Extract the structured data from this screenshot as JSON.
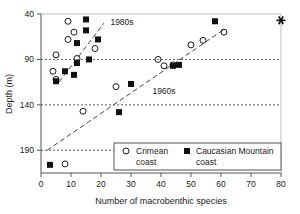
{
  "chart_data": {
    "type": "scatter",
    "title": "",
    "xlabel": "Number of macrobenthic species",
    "ylabel": "Depth (m)",
    "xlim": [
      0,
      80
    ],
    "ylim": [
      40,
      215
    ],
    "y_inverted": true,
    "xticks": [
      0,
      10,
      20,
      30,
      40,
      50,
      60,
      70,
      80
    ],
    "xtick_labels": [
      "0",
      "10",
      "20",
      "30",
      "40",
      "50",
      "60",
      "70",
      "80"
    ],
    "yticks": [
      40,
      90,
      140,
      190
    ],
    "ytick_labels": [
      "40",
      "90",
      "140",
      "190"
    ],
    "grid": "horizontal-dashed",
    "gridlines_y": [
      90,
      140,
      190
    ],
    "legend_position": "lower-right",
    "series": [
      {
        "name": "Crimean coast",
        "marker": "open-circle",
        "color": "#1a1a1a",
        "points": [
          [
            9,
            48
          ],
          [
            11,
            60
          ],
          [
            9,
            68
          ],
          [
            5,
            85
          ],
          [
            4,
            103
          ],
          [
            12,
            89
          ],
          [
            18,
            78
          ],
          [
            5,
            112
          ],
          [
            14,
            147
          ],
          [
            25,
            120
          ],
          [
            39,
            90
          ],
          [
            41,
            97
          ],
          [
            44,
            96
          ],
          [
            50,
            74
          ],
          [
            54,
            69
          ],
          [
            61,
            60
          ],
          [
            8,
            205
          ]
        ]
      },
      {
        "name": "Caucasian Mountain coast",
        "marker": "filled-square",
        "color": "#111111",
        "points": [
          [
            15,
            46
          ],
          [
            15,
            58
          ],
          [
            19,
            68
          ],
          [
            12,
            72
          ],
          [
            12,
            94
          ],
          [
            16,
            90
          ],
          [
            11,
            107
          ],
          [
            8,
            103
          ],
          [
            5,
            114
          ],
          [
            26,
            148
          ],
          [
            30,
            117
          ],
          [
            44,
            97
          ],
          [
            46,
            96
          ],
          [
            58,
            48
          ],
          [
            3,
            206
          ]
        ]
      }
    ],
    "trend_lines": [
      {
        "name": "1980s",
        "style": "dashed",
        "x": [
          6,
          21
        ],
        "y": [
          115,
          50
        ]
      },
      {
        "name": "1960s",
        "style": "dashed",
        "x": [
          2,
          61
        ],
        "y": [
          190,
          57
        ]
      }
    ],
    "annotations": [
      {
        "text": "1980s",
        "x": 27,
        "y": 52
      },
      {
        "text": "1960s",
        "x": 41,
        "y": 128
      }
    ],
    "special_markers": [
      {
        "marker": "star",
        "x": 80,
        "y": 47
      }
    ]
  },
  "legend": {
    "entries": [
      {
        "label_line1": "Crimean",
        "label_line2": "coast",
        "marker": "open-circle"
      },
      {
        "label_line1": "Caucasian Mountain",
        "label_line2": "coast",
        "marker": "filled-square"
      }
    ]
  }
}
